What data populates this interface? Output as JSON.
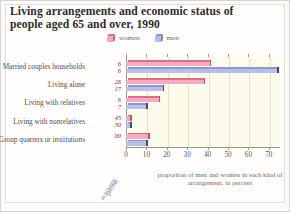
{
  "chart_data": {
    "type": "bar",
    "orientation": "horizontal",
    "title": "Living arrangements and economic status of people aged 65 and over, 1990",
    "xlabel": "proportion of men and women in each kind of arrangement, in percent",
    "ylabel": "",
    "secondary_axis_label_line1": "percent",
    "secondary_axis_label_line2": "in poverty",
    "xlim": [
      0,
      75
    ],
    "xticks": [
      0,
      10,
      20,
      30,
      40,
      50,
      60,
      70
    ],
    "grid": true,
    "legend_position": "top-center",
    "categories": [
      "Married couples households",
      "Living alone",
      "Living with relatives",
      "Living with nonrelatives",
      "Group quarters or institutions"
    ],
    "series": [
      {
        "name": "women",
        "color": "#f4abc4",
        "values": [
          41,
          38,
          16,
          2,
          11
        ],
        "poverty_labels": [
          "6",
          "26",
          "6",
          "45",
          "00"
        ]
      },
      {
        "name": "men",
        "color": "#b7bfe6",
        "values": [
          74,
          18,
          10,
          2,
          10
        ],
        "poverty_labels": [
          "6",
          "17",
          "7",
          "30",
          ""
        ]
      }
    ]
  },
  "legend": {
    "women_label": "women",
    "men_label": "men"
  }
}
